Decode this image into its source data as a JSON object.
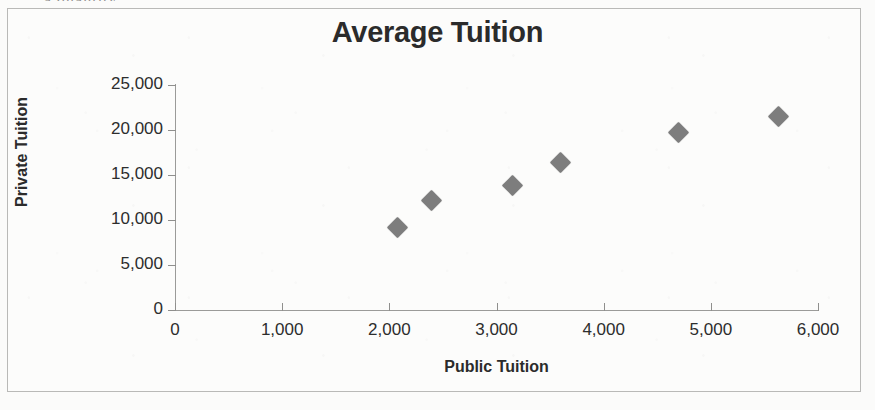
{
  "document": {
    "top_partial_text": "a quantity",
    "background_color": "#fbfbfa",
    "frame_color": "#b9b9b7"
  },
  "chart_data": {
    "type": "scatter",
    "title": "Average Tuition",
    "xlabel": "Public Tuition",
    "ylabel": "Private Tuition",
    "xlim": [
      0,
      6000
    ],
    "ylim": [
      0,
      25000
    ],
    "grid": false,
    "legend": false,
    "marker": {
      "shape": "diamond",
      "color": "#7d7d7d",
      "size": 15
    },
    "xticks": [
      0,
      1000,
      2000,
      3000,
      4000,
      5000,
      6000
    ],
    "xtick_labels": [
      "0",
      "1,000",
      "2,000",
      "3,000",
      "4,000",
      "5,000",
      "6,000"
    ],
    "yticks": [
      0,
      5000,
      10000,
      15000,
      20000,
      25000
    ],
    "ytick_labels": [
      "0",
      "5,000",
      "10,000",
      "15,000",
      "20,000",
      "25,000"
    ],
    "points": [
      {
        "x": 2080,
        "y": 9200
      },
      {
        "x": 2390,
        "y": 12200
      },
      {
        "x": 3150,
        "y": 13800
      },
      {
        "x": 3600,
        "y": 16400
      },
      {
        "x": 4700,
        "y": 19700
      },
      {
        "x": 5630,
        "y": 21500
      }
    ]
  }
}
